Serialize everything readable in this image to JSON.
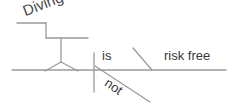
{
  "diagram": {
    "type": "sentence-diagram",
    "style": "reed-kellogg",
    "background_color": "#ffffff",
    "line_color": "#9a9a9a",
    "text_color": "#3a3a3a",
    "sentence": "Diving is not risk free",
    "labels": {
      "subject": "Diving",
      "verb": "is",
      "modifier": "not",
      "complement": "risk free"
    },
    "parts": [
      {
        "name": "subject-line",
        "label": "Diving"
      },
      {
        "name": "verb-line",
        "label": "is"
      },
      {
        "name": "adverb-slant",
        "label": "not"
      },
      {
        "name": "complement-line",
        "label": "risk free"
      }
    ]
  }
}
